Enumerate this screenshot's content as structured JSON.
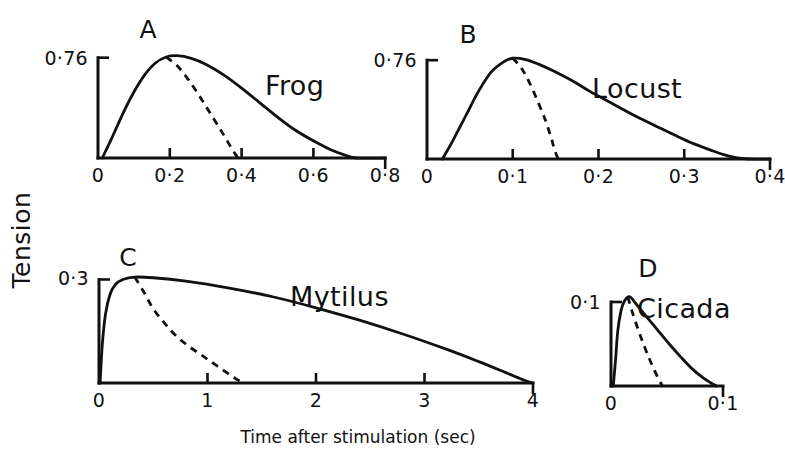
{
  "figure": {
    "x_axis_title": "Time after stimulation (sec)",
    "y_axis_title": "Tension",
    "background_color": "#ffffff",
    "ink_color": "#111111"
  },
  "chart_data": {
    "type": "line",
    "xlabel": "Time after stimulation (sec)",
    "ylabel": "Tension",
    "grid": false,
    "legend": "none",
    "panel_count": 4,
    "panels": [
      {
        "letter": "A",
        "species": "Frog",
        "ylim": [
          0,
          0.76
        ],
        "ytick_labels": [
          "0.76"
        ],
        "ytick_values": [
          0.76
        ],
        "xlim": [
          0,
          0.8
        ],
        "xtick_labels": [
          "0",
          "0.2",
          "0.4",
          "0.6",
          "0.8"
        ],
        "xtick_values": [
          0,
          0.2,
          0.4,
          0.6,
          0.8
        ],
        "series": [
          {
            "name": "active state decay (solid)",
            "style": "solid",
            "points": [
              [
                0.012,
                0.0
              ],
              [
                0.04,
                0.16
              ],
              [
                0.07,
                0.34
              ],
              [
                0.1,
                0.5
              ],
              [
                0.13,
                0.63
              ],
              [
                0.16,
                0.72
              ],
              [
                0.19,
                0.765
              ],
              [
                0.22,
                0.775
              ],
              [
                0.26,
                0.755
              ],
              [
                0.3,
                0.71
              ],
              [
                0.35,
                0.63
              ],
              [
                0.4,
                0.53
              ],
              [
                0.45,
                0.42
              ],
              [
                0.5,
                0.31
              ],
              [
                0.55,
                0.21
              ],
              [
                0.6,
                0.13
              ],
              [
                0.65,
                0.06
              ],
              [
                0.69,
                0.02
              ],
              [
                0.72,
                0.0
              ],
              [
                0.8,
                0.0
              ]
            ]
          },
          {
            "name": "isometric twitch (dashed)",
            "style": "dashed",
            "points": [
              [
                0.19,
                0.765
              ],
              [
                0.22,
                0.7
              ],
              [
                0.25,
                0.6
              ],
              [
                0.28,
                0.48
              ],
              [
                0.31,
                0.35
              ],
              [
                0.34,
                0.22
              ],
              [
                0.36,
                0.13
              ],
              [
                0.375,
                0.06
              ],
              [
                0.385,
                0.02
              ],
              [
                0.39,
                0.0
              ]
            ]
          }
        ]
      },
      {
        "letter": "B",
        "species": "Locust",
        "ylim": [
          0,
          0.76
        ],
        "ytick_labels": [
          "0.76"
        ],
        "ytick_values": [
          0.76
        ],
        "xlim": [
          0,
          0.4
        ],
        "xtick_labels": [
          "0",
          "0.1",
          "0.2",
          "0.3",
          "0.4"
        ],
        "xtick_values": [
          0,
          0.1,
          0.2,
          0.3,
          0.4
        ],
        "series": [
          {
            "name": "active state decay (solid)",
            "style": "solid",
            "points": [
              [
                0.018,
                0.0
              ],
              [
                0.03,
                0.14
              ],
              [
                0.045,
                0.33
              ],
              [
                0.06,
                0.52
              ],
              [
                0.075,
                0.67
              ],
              [
                0.09,
                0.75
              ],
              [
                0.1,
                0.775
              ],
              [
                0.115,
                0.765
              ],
              [
                0.13,
                0.73
              ],
              [
                0.15,
                0.67
              ],
              [
                0.17,
                0.6
              ],
              [
                0.19,
                0.52
              ],
              [
                0.215,
                0.43
              ],
              [
                0.24,
                0.34
              ],
              [
                0.265,
                0.26
              ],
              [
                0.29,
                0.18
              ],
              [
                0.31,
                0.12
              ],
              [
                0.33,
                0.07
              ],
              [
                0.345,
                0.035
              ],
              [
                0.36,
                0.01
              ],
              [
                0.375,
                0.0
              ],
              [
                0.4,
                0.0
              ]
            ]
          },
          {
            "name": "isometric twitch (dashed)",
            "style": "dashed",
            "points": [
              [
                0.1,
                0.775
              ],
              [
                0.11,
                0.7
              ],
              [
                0.12,
                0.58
              ],
              [
                0.13,
                0.43
              ],
              [
                0.138,
                0.3
              ],
              [
                0.144,
                0.18
              ],
              [
                0.148,
                0.09
              ],
              [
                0.151,
                0.03
              ],
              [
                0.153,
                0.0
              ]
            ]
          }
        ]
      },
      {
        "letter": "C",
        "species": "Mytilus",
        "ylim": [
          0,
          0.3
        ],
        "ytick_labels": [
          "0.3"
        ],
        "ytick_values": [
          0.3
        ],
        "xlim": [
          0,
          4
        ],
        "xtick_labels": [
          "0",
          "1",
          "2",
          "3",
          "4"
        ],
        "xtick_values": [
          0,
          1,
          2,
          3,
          4
        ],
        "series": [
          {
            "name": "active state decay (solid)",
            "style": "solid",
            "points": [
              [
                0.01,
                0.0
              ],
              [
                0.03,
                0.11
              ],
              [
                0.06,
                0.2
              ],
              [
                0.1,
                0.255
              ],
              [
                0.15,
                0.285
              ],
              [
                0.22,
                0.3
              ],
              [
                0.33,
                0.307
              ],
              [
                0.5,
                0.305
              ],
              [
                0.8,
                0.295
              ],
              [
                1.2,
                0.275
              ],
              [
                1.6,
                0.25
              ],
              [
                2.0,
                0.218
              ],
              [
                2.4,
                0.182
              ],
              [
                2.8,
                0.142
              ],
              [
                3.2,
                0.098
              ],
              [
                3.5,
                0.062
              ],
              [
                3.75,
                0.03
              ],
              [
                3.92,
                0.008
              ],
              [
                4.0,
                0.0
              ]
            ]
          },
          {
            "name": "isometric twitch (dashed)",
            "style": "dashed",
            "points": [
              [
                0.33,
                0.307
              ],
              [
                0.42,
                0.26
              ],
              [
                0.5,
                0.215
              ],
              [
                0.6,
                0.175
              ],
              [
                0.7,
                0.14
              ],
              [
                0.82,
                0.108
              ],
              [
                0.95,
                0.08
              ],
              [
                1.05,
                0.058
              ],
              [
                1.15,
                0.036
              ],
              [
                1.25,
                0.015
              ],
              [
                1.33,
                0.0
              ]
            ]
          }
        ]
      },
      {
        "letter": "D",
        "species": "Cicada",
        "ylim": [
          0,
          0.1
        ],
        "ytick_labels": [
          "0.1"
        ],
        "ytick_values": [
          0.1
        ],
        "xlim": [
          0,
          0.1
        ],
        "xtick_labels": [
          "0",
          "0.1"
        ],
        "xtick_values": [
          0,
          0.1
        ],
        "series": [
          {
            "name": "active state decay (solid)",
            "style": "solid",
            "points": [
              [
                0.002,
                0.0
              ],
              [
                0.004,
                0.03
              ],
              [
                0.006,
                0.065
              ],
              [
                0.009,
                0.09
              ],
              [
                0.012,
                0.101
              ],
              [
                0.015,
                0.106
              ],
              [
                0.018,
                0.105
              ],
              [
                0.024,
                0.095
              ],
              [
                0.032,
                0.082
              ],
              [
                0.042,
                0.066
              ],
              [
                0.052,
                0.05
              ],
              [
                0.062,
                0.035
              ],
              [
                0.072,
                0.021
              ],
              [
                0.082,
                0.01
              ],
              [
                0.09,
                0.003
              ],
              [
                0.094,
                0.0
              ]
            ]
          },
          {
            "name": "isometric twitch (dashed)",
            "style": "dashed",
            "points": [
              [
                0.015,
                0.106
              ],
              [
                0.019,
                0.088
              ],
              [
                0.024,
                0.068
              ],
              [
                0.029,
                0.05
              ],
              [
                0.034,
                0.033
              ],
              [
                0.039,
                0.018
              ],
              [
                0.043,
                0.007
              ],
              [
                0.046,
                0.0
              ]
            ]
          }
        ]
      }
    ]
  },
  "panel_geometry": [
    {
      "key": "A",
      "ox": 98,
      "oy": 158,
      "px_per_x": 359.0,
      "px_per_y": 132.0,
      "label_x": 265,
      "label_y": 95,
      "letter_x": 148,
      "letter_y": 38,
      "ytick_label_x": 88,
      "ytick_label_y": 65,
      "xlabel_y": 182
    },
    {
      "key": "B",
      "ox": 427,
      "oy": 159,
      "px_per_x": 857.5,
      "px_per_y": 130.0,
      "label_x": 592,
      "label_y": 98,
      "letter_x": 468,
      "letter_y": 43,
      "ytick_label_x": 417,
      "ytick_label_y": 67,
      "xlabel_y": 183
    },
    {
      "key": "C",
      "ox": 99,
      "oy": 383,
      "px_per_x": 108.5,
      "px_per_y": 345.0,
      "label_x": 290,
      "label_y": 306,
      "letter_x": 128,
      "letter_y": 266,
      "ytick_label_x": 89,
      "ytick_label_y": 285,
      "xlabel_y": 407
    },
    {
      "key": "D",
      "ox": 611,
      "oy": 386,
      "px_per_x": 1120.0,
      "px_per_y": 840.0,
      "label_x": 637,
      "label_y": 318,
      "letter_x": 648,
      "letter_y": 277,
      "ytick_label_x": 601,
      "ytick_label_y": 309,
      "xlabel_y": 410
    }
  ],
  "axis_titles": {
    "x_title_x": 358,
    "x_title_y": 443,
    "y_title_x": 30,
    "y_title_y": 240
  }
}
